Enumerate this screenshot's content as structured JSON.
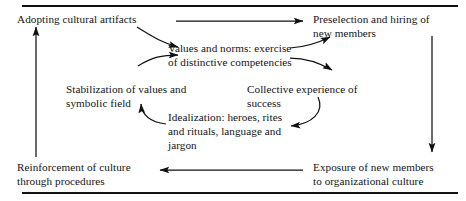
{
  "figure": {
    "background_color": "#ffffff",
    "text_color": "#141414",
    "rule_color": "#111111",
    "width": 466,
    "height": 201
  },
  "rules": {
    "top_rule_label": "top horizontal rule",
    "bottom_rule_label": "bottom horizontal rule"
  },
  "nodes": {
    "artifacts": "Adopting cultural artifacts",
    "preselection": "Preselection and hiring of\nnew members",
    "values": "Values and norms: exercise\nof distinctive competencies",
    "stabilization": "Stabilization of values and\nsymbolic field",
    "collective": "Collective experience of\nsuccess",
    "idealization": "Idealization: heroes, rites\nand rituals, language and\njargon",
    "reinforcement": "Reinforcement of culture\nthrough procedures",
    "exposure": "Exposure of new members\nto organizational culture"
  },
  "arrows": [
    {
      "name": "artifacts-to-preselection",
      "style": "straight-horizontal",
      "direction": "right"
    },
    {
      "name": "artifacts-to-values",
      "style": "curved",
      "direction": "down-right"
    },
    {
      "name": "stabilization-to-values",
      "style": "curved",
      "direction": "up-right"
    },
    {
      "name": "values-to-preselection",
      "style": "curved",
      "direction": "up-right"
    },
    {
      "name": "values-to-collective",
      "style": "curved",
      "direction": "down-right"
    },
    {
      "name": "collective-to-idealization",
      "style": "curved",
      "direction": "down-left"
    },
    {
      "name": "idealization-to-stabilization",
      "style": "curved",
      "direction": "up-left"
    },
    {
      "name": "preselection-to-exposure",
      "style": "straight-vertical",
      "direction": "down"
    },
    {
      "name": "exposure-to-reinforcement",
      "style": "straight-horizontal",
      "direction": "left"
    },
    {
      "name": "reinforcement-to-artifacts",
      "style": "straight-vertical",
      "direction": "up"
    }
  ]
}
